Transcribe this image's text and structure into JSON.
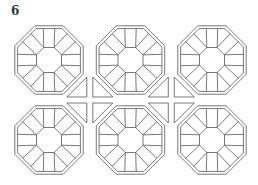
{
  "figure": {
    "label": "6",
    "grid": {
      "rows": 2,
      "columns": 3
    },
    "line_color": "#555555",
    "background": "#ffffff"
  }
}
